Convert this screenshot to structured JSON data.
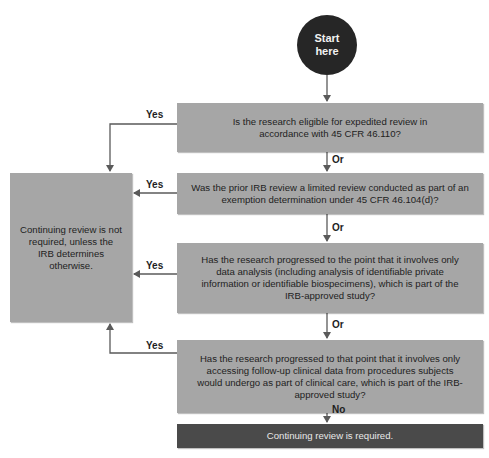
{
  "start": {
    "label_line1": "Start",
    "label_line2": "here"
  },
  "questions": [
    {
      "text": "Is the research eligible for expedited review in accordance with 45 CFR 46.110?"
    },
    {
      "text": "Was the prior IRB review a limited review conducted as part of an exemption determination under 45 CFR 46.104(d)?"
    },
    {
      "text": "Has the research progressed to the point that it involves only data analysis (including analysis of identifiable private information or identifiable biospecimens), which is part of the IRB-approved study?"
    },
    {
      "text": "Has the research progressed to that point that it involves only accessing follow-up clinical data from procedures subjects would undergo as part of clinical care, which is part of the IRB-approved study?"
    }
  ],
  "outcomes": {
    "not_required": "Continuing review is not required, unless the IRB determines otherwise.",
    "required": "Continuing review is required."
  },
  "edge_labels": {
    "yes": [
      "Yes",
      "Yes",
      "Yes",
      "Yes"
    ],
    "or": [
      "Or",
      "Or",
      "Or"
    ],
    "no": "No"
  },
  "colors": {
    "question_box": "#a6a6a6",
    "start_circle": "#262626",
    "required_box": "#4a4a4a",
    "lines": "#5a5a5a"
  }
}
